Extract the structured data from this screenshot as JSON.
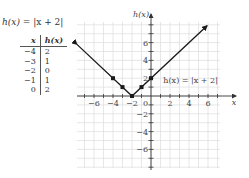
{
  "title": {
    "func": "h(x)",
    "equals": " = ",
    "expr": "|x + 2|"
  },
  "table": {
    "headers": [
      "x",
      "h(x)"
    ],
    "rows": [
      [
        "−4",
        "2"
      ],
      [
        "−3",
        "1"
      ],
      [
        "−2",
        "0"
      ],
      [
        "−1",
        "1"
      ],
      [
        "0",
        "2"
      ]
    ]
  },
  "chart_data": {
    "type": "line",
    "title": "h(x) = |x + 2|",
    "xlabel": "x",
    "ylabel": "h(x)",
    "xlim": [
      -7.5,
      7.5
    ],
    "ylim": [
      -8,
      8
    ],
    "grid": true,
    "x_ticks": [
      -6,
      -4,
      -2,
      2,
      4,
      6
    ],
    "y_ticks": [
      -6,
      -4,
      -2,
      2,
      4,
      6
    ],
    "origin_label": "0",
    "series": [
      {
        "name": "h(x) = |x + 2|",
        "x": [
          -7.8,
          -2,
          5.9
        ],
        "y": [
          5.8,
          0,
          7.9
        ],
        "arrows_both_ends": true
      }
    ],
    "points": [
      {
        "x": -4,
        "y": 2
      },
      {
        "x": -3,
        "y": 1
      },
      {
        "x": -2,
        "y": 0
      },
      {
        "x": -1,
        "y": 1
      },
      {
        "x": 0,
        "y": 2
      }
    ],
    "annotations": [
      {
        "text": "h(x) = |x + 2|",
        "x": 1.3,
        "y": 1.8
      }
    ]
  },
  "colors": {
    "grid": "#dcdcdc",
    "axis": "#333333",
    "line": "#1a1a1a",
    "text": "#444444"
  }
}
